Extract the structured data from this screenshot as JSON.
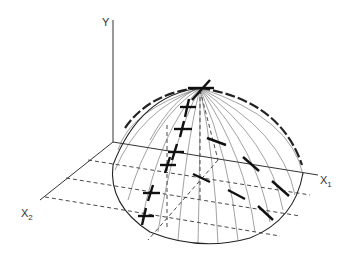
{
  "diagram": {
    "type": "3d-surface-dome",
    "axes": {
      "y": {
        "label": "Y"
      },
      "x1": {
        "label": "X",
        "subscript": "1"
      },
      "x2": {
        "label": "X",
        "subscript": "2"
      }
    },
    "colors": {
      "ink": "#222222",
      "background": "#ffffff"
    },
    "elements": [
      "vertical Y axis",
      "X1 axis on base plane",
      "X2 axis on base plane",
      "dashed grid lines parallel to X1",
      "dome-shaped surface with meridian lines",
      "cross markers along ridge toward X2",
      "dash markers along direction toward X1"
    ]
  }
}
